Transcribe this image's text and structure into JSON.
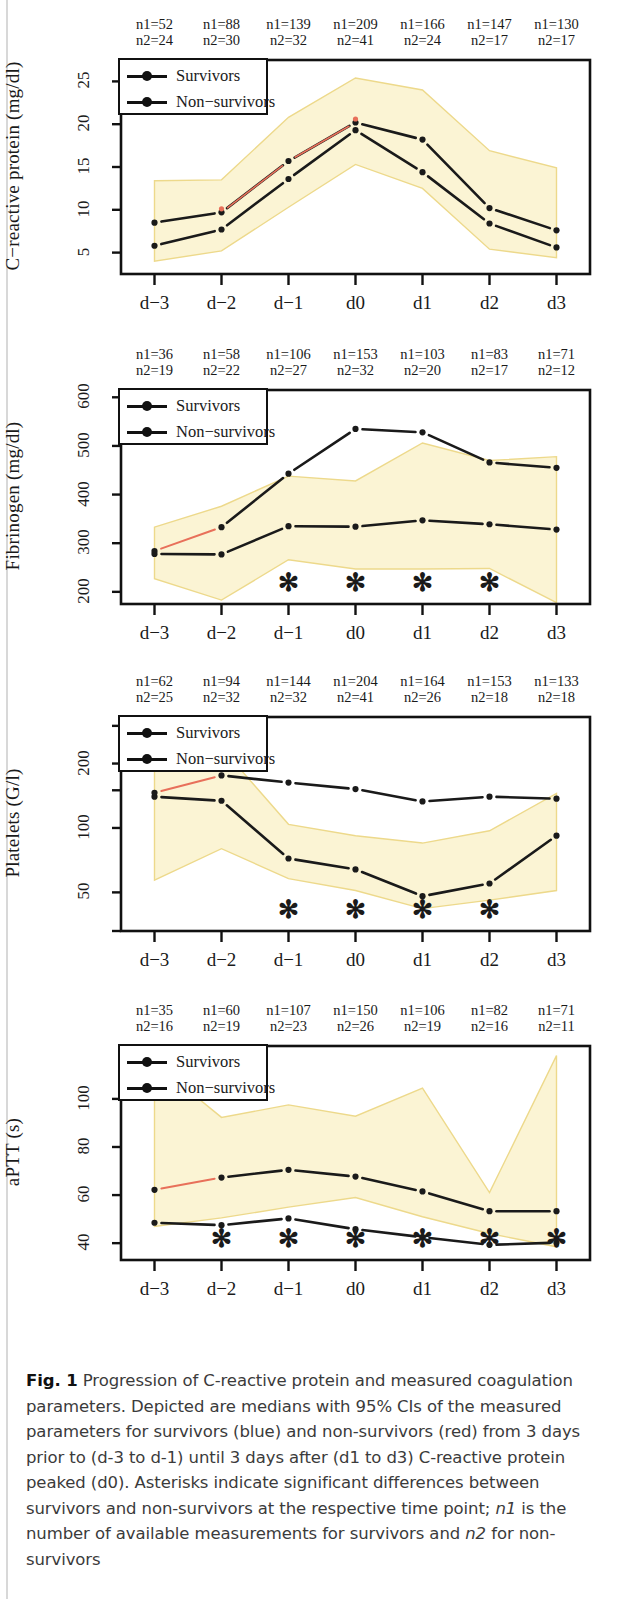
{
  "figure": {
    "label": "Fig. 1",
    "caption": "Progression of C-reactive protein and measured coagulation parameters. Depicted are medians with 95% CIs of the measured parameters for survivors (blue) and non-survivors (red) from 3 days prior to (d-3 to d-1) until 3 days after (d1 to d3) C-reactive protein peaked (d0). Asterisks indicate significant differences between survivors and non-survivors at the respective time point; n1 is the number of available measurements for survivors and n2 for non-survivors",
    "caption_parts": {
      "p1": "Progression of C-reactive protein and measured coagulation parameters. Depicted are medians with 95% CIs of the measured parameters for survivors (blue) and non-survivors (red) from 3 days prior to (d-3 to d-1) until 3 days after (d1 to d3) C-reactive protein peaked (d0). Asterisks indicate significant differences between survivors and non-survivors at the respective time point; ",
      "n1": "n1",
      "p2": " is the number of available measurements for survivors and ",
      "n2": "n2",
      "p3": " for non-survivors"
    }
  },
  "legend": {
    "survivors": "Survivors",
    "non_survivors": "Non−survivors"
  },
  "chart_data": [
    {
      "type": "line",
      "title": "C-reactive protein",
      "ylabel": "C−reactive protein (mg/dl)",
      "xlabel": "",
      "categories": [
        "d−3",
        "d−2",
        "d−1",
        "d0",
        "d1",
        "d2",
        "d3"
      ],
      "yticks": [
        5,
        10,
        15,
        20,
        25
      ],
      "ylim": [
        2.5,
        27.5
      ],
      "yscale": "linear",
      "grid": false,
      "legend_position": "top-left",
      "series": [
        {
          "name": "Survivors",
          "values": [
            5.8,
            7.7,
            13.6,
            19.3,
            14.4,
            8.4,
            5.6
          ]
        },
        {
          "name": "Non−survivors",
          "values": [
            8.5,
            9.7,
            15.7,
            20.2,
            18.2,
            10.2,
            7.6
          ]
        }
      ],
      "ci_band": {
        "upper": [
          13.4,
          13.5,
          20.8,
          25.4,
          24.0,
          16.9,
          14.9
        ],
        "lower": [
          4.0,
          5.2,
          10.3,
          15.3,
          12.5,
          5.4,
          4.4
        ]
      },
      "n1_label": "n1",
      "n2_label": "n2",
      "n1": [
        52,
        88,
        139,
        209,
        166,
        147,
        130
      ],
      "n2": [
        24,
        30,
        32,
        41,
        24,
        17,
        17
      ],
      "significance": []
    },
    {
      "type": "line",
      "title": "Fibrinogen",
      "ylabel": "Fibrinogen (mg/dl)",
      "xlabel": "",
      "categories": [
        "d−3",
        "d−2",
        "d−1",
        "d0",
        "d1",
        "d2",
        "d3"
      ],
      "yticks": [
        200,
        300,
        400,
        500,
        600
      ],
      "ylim": [
        175,
        615
      ],
      "yscale": "linear",
      "grid": false,
      "legend_position": "top-left",
      "series": [
        {
          "name": "Survivors",
          "values": [
            278,
            277,
            335,
            334,
            347,
            339,
            328
          ]
        },
        {
          "name": "Non−survivors",
          "values": [
            284,
            333,
            443,
            535,
            528,
            466,
            455
          ]
        }
      ],
      "ci_band": {
        "upper": [
          333,
          376,
          438,
          428,
          506,
          470,
          478
        ],
        "lower": [
          227,
          183,
          266,
          247,
          247,
          248,
          178
        ]
      },
      "n1_label": "n1",
      "n2_label": "n2",
      "n1": [
        36,
        58,
        106,
        153,
        103,
        83,
        71
      ],
      "n2": [
        19,
        22,
        27,
        32,
        20,
        17,
        12
      ],
      "significance": [
        "d−1",
        "d0",
        "d1",
        "d2"
      ]
    },
    {
      "type": "line",
      "title": "Platelets",
      "ylabel": "Platelets (G/l)",
      "xlabel": "",
      "categories": [
        "d−3",
        "d−2",
        "d−1",
        "d0",
        "d1",
        "d2",
        "d3"
      ],
      "yticks": [
        50,
        100,
        200
      ],
      "ylim": [
        33,
        330
      ],
      "yscale": "log",
      "grid": false,
      "legend_position": "top-left",
      "series": [
        {
          "name": "Survivors",
          "values": [
            140,
            134,
            72,
            64,
            48,
            55,
            92
          ]
        },
        {
          "name": "Non−survivors",
          "values": [
            146,
            176,
            163,
            152,
            133,
            140,
            137
          ]
        }
      ],
      "ci_band": {
        "upper": [
          232,
          237,
          104,
          92,
          85,
          97,
          145
        ],
        "lower": [
          57,
          80,
          58,
          51,
          42,
          46,
          51
        ]
      },
      "n1_label": "n1",
      "n2_label": "n2",
      "n1": [
        62,
        94,
        144,
        204,
        164,
        153,
        133
      ],
      "n2": [
        25,
        32,
        32,
        41,
        26,
        18,
        18
      ],
      "significance": [
        "d−1",
        "d0",
        "d1",
        "d2"
      ]
    },
    {
      "type": "line",
      "title": "aPTT",
      "ylabel": "aPTT (s)",
      "xlabel": "",
      "categories": [
        "d−3",
        "d−2",
        "d−1",
        "d0",
        "d1",
        "d2",
        "d3"
      ],
      "yticks": [
        40,
        60,
        80,
        100
      ],
      "ylim": [
        33,
        122
      ],
      "yscale": "linear",
      "grid": false,
      "legend_position": "top-left",
      "series": [
        {
          "name": "Survivors",
          "values": [
            48.5,
            47.5,
            50.3,
            45.8,
            42.5,
            39.3,
            40.2
          ]
        },
        {
          "name": "Non−survivors",
          "values": [
            62.2,
            67.3,
            70.5,
            67.7,
            61.5,
            53.3,
            53.3
          ]
        }
      ],
      "ci_band": {
        "upper": [
          115,
          92.3,
          97.5,
          92.8,
          104.5,
          61.0,
          118.0
        ],
        "lower": [
          47.0,
          50.5,
          55.0,
          59.0,
          51.0,
          44.0,
          38.5
        ]
      },
      "n1_label": "n1",
      "n2_label": "n2",
      "n1": [
        35,
        60,
        107,
        150,
        106,
        82,
        71
      ],
      "n2": [
        16,
        19,
        23,
        26,
        19,
        16,
        11
      ],
      "significance": [
        "d−2",
        "d−1",
        "d0",
        "d1",
        "d2",
        "d3"
      ]
    }
  ],
  "colors": {
    "line": "#1a1a1a",
    "ci_band": "#fbf4d4",
    "ci_edge": "#edd98b",
    "red_segment": "#e8705a",
    "frame": "#111111"
  },
  "asterisk_glyph": "✻"
}
